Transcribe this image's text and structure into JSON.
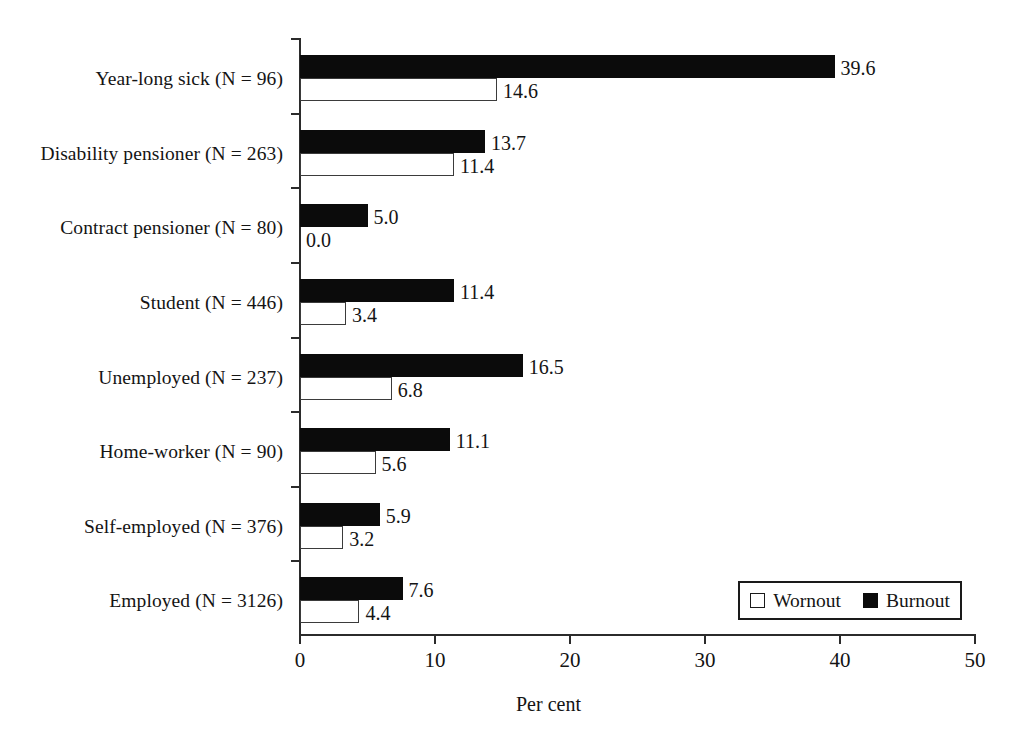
{
  "chart_data": {
    "type": "bar",
    "orientation": "horizontal",
    "title": "",
    "xlabel": "Per cent",
    "ylabel": "",
    "xlim": [
      0,
      50
    ],
    "xticks": [
      0,
      10,
      20,
      30,
      40,
      50
    ],
    "xtick_labels": [
      "0",
      "10",
      "20",
      "30",
      "40",
      "50"
    ],
    "grid": false,
    "legend_position": "bottom-right",
    "categories": [
      "Year-long sick (N = 96)",
      "Disability pensioner (N = 263)",
      "Contract pensioner (N = 80)",
      "Student (N = 446)",
      "Unemployed (N = 237)",
      "Home-worker (N = 90)",
      "Self-employed (N = 376)",
      "Employed (N = 3126)"
    ],
    "series": [
      {
        "name": "Burnout",
        "color": "#0b0b0b",
        "style": "filled",
        "values": [
          39.6,
          13.7,
          5.0,
          11.4,
          16.5,
          11.1,
          5.9,
          7.6
        ],
        "labels": [
          "39.6",
          "13.7",
          "5.0",
          "11.4",
          "16.5",
          "11.1",
          "5.9",
          "7.6"
        ]
      },
      {
        "name": "Wornout",
        "color": "#ffffff",
        "style": "open",
        "values": [
          14.6,
          11.4,
          0.0,
          3.4,
          6.8,
          5.6,
          3.2,
          4.4
        ],
        "labels": [
          "14.6",
          "11.4",
          "0.0",
          "3.4",
          "6.8",
          "5.6",
          "3.2",
          "4.4"
        ]
      }
    ]
  },
  "legend": {
    "entries": [
      {
        "label": "Wornout",
        "swatch": "open-square-icon"
      },
      {
        "label": "Burnout",
        "swatch": "filled-square-icon"
      }
    ]
  },
  "axis": {
    "x_title": "Per cent"
  }
}
